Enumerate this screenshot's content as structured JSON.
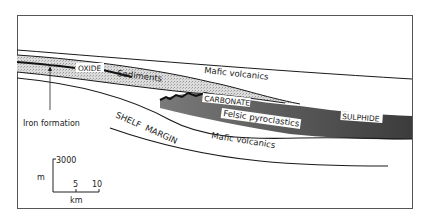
{
  "diagram": {
    "labels": {
      "oxide": "OXIDE",
      "sediments": "Sediments",
      "mafic_upper": "Mafic volcanics",
      "carbonate": "CARBONATE",
      "felsic": "Felsic pyroclastics",
      "sulphide": "SULPHIDE",
      "mafic_lower": "Mafic volcanics",
      "shelf_margin": "SHELF  MARGIN",
      "iron_formation": "Iron formation"
    },
    "scale_bar": {
      "vertical_unit": "m",
      "vertical_value": "3000",
      "horizontal_unit": "km",
      "tick_5": "5",
      "tick_10": "10"
    },
    "colors": {
      "frame": "#555555",
      "line": "#1a1a1a",
      "sediment_fill": "#d4d4d4",
      "felsic_fill": "#6a6a6a",
      "felsic_dark": "#3a3a3a",
      "background": "#ffffff"
    }
  }
}
